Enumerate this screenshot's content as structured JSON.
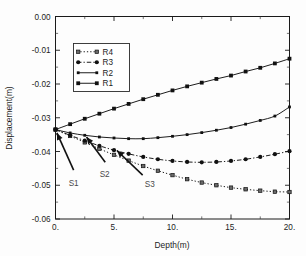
{
  "chart_data": {
    "type": "line",
    "title": "",
    "xlabel": "Depth(m)",
    "ylabel": "Displacement(m)",
    "xlim": [
      0,
      20
    ],
    "ylim": [
      -0.06,
      0.0
    ],
    "xticks": [
      0,
      5,
      10,
      15,
      20
    ],
    "xticklabels": [
      "0.",
      "5.",
      "10.",
      "15.",
      "20."
    ],
    "yticks": [
      0.0,
      -0.01,
      -0.02,
      -0.03,
      -0.04,
      -0.05,
      -0.06
    ],
    "yticklabels": [
      "0.00",
      "-0.01",
      "-0.02",
      "-0.03",
      "-0.04",
      "-0.05",
      "-0.06"
    ],
    "grid": false,
    "legend_position": "upper-left-inset",
    "legend_entries": [
      "R4",
      "R3",
      "R2",
      "R1"
    ],
    "x": [
      0,
      1.25,
      2.5,
      3.75,
      5,
      6.25,
      7.5,
      8.75,
      10,
      11.25,
      12.5,
      13.75,
      15,
      16.25,
      17.5,
      18.75,
      20
    ],
    "series": [
      {
        "name": "R1",
        "style": "solid",
        "marker": "filled-square",
        "values": [
          -0.0335,
          -0.0319,
          -0.0303,
          -0.0288,
          -0.0273,
          -0.0259,
          -0.0245,
          -0.0232,
          -0.0219,
          -0.0207,
          -0.0196,
          -0.0185,
          -0.0175,
          -0.0163,
          -0.0152,
          -0.0139,
          -0.0125
        ]
      },
      {
        "name": "R2",
        "style": "solid",
        "marker": "small-square",
        "values": [
          -0.0335,
          -0.0345,
          -0.0352,
          -0.0357,
          -0.036,
          -0.0362,
          -0.0362,
          -0.0359,
          -0.0355,
          -0.035,
          -0.0344,
          -0.0337,
          -0.0329,
          -0.0319,
          -0.0308,
          -0.0295,
          -0.0268
        ]
      },
      {
        "name": "R3",
        "style": "dash-dot",
        "marker": "filled-circle",
        "values": [
          -0.0335,
          -0.0352,
          -0.0368,
          -0.0383,
          -0.0396,
          -0.0407,
          -0.0416,
          -0.0423,
          -0.0428,
          -0.0431,
          -0.0432,
          -0.0431,
          -0.0428,
          -0.0423,
          -0.0416,
          -0.0408,
          -0.0399
        ]
      },
      {
        "name": "R4",
        "style": "dotted",
        "marker": "x-square",
        "values": [
          -0.0335,
          -0.0354,
          -0.0373,
          -0.0392,
          -0.041,
          -0.0427,
          -0.0443,
          -0.0457,
          -0.047,
          -0.0482,
          -0.0492,
          -0.05,
          -0.0507,
          -0.0512,
          -0.0516,
          -0.0519,
          -0.052
        ]
      }
    ],
    "annotations": [
      {
        "label": "S1",
        "label_x": 1.55,
        "label_y": -0.0503,
        "tip_x": 0.12,
        "tip_y": -0.0345,
        "tail_x": 1.55,
        "tail_y": -0.0455
      },
      {
        "label": "S2",
        "label_x": 4.2,
        "label_y": -0.0477,
        "tip_x": 2.65,
        "tip_y": -0.0357,
        "tail_x": 4.25,
        "tail_y": -0.0432
      },
      {
        "label": "S3",
        "label_x": 8.05,
        "label_y": -0.0505,
        "tip_x": 5.25,
        "tip_y": -0.0397,
        "tail_x": 7.45,
        "tail_y": -0.047
      }
    ],
    "colors": {
      "line": "#111111",
      "axis": "#1a1a1a",
      "text": "#1c1c1c",
      "annotation_text": "#4a4a4a",
      "background": "#fdfdfd"
    }
  }
}
